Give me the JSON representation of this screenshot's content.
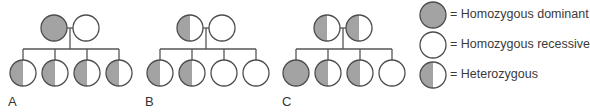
{
  "colors": {
    "fill": "#a3a3a3",
    "stroke": "#4d4d4d",
    "empty": "#ffffff",
    "line": "#555555"
  },
  "pedigrees": [
    {
      "label": "A",
      "parents": [
        "dominant",
        "recessive"
      ],
      "children": [
        "heterozygous",
        "heterozygous",
        "heterozygous",
        "heterozygous"
      ]
    },
    {
      "label": "B",
      "parents": [
        "heterozygous",
        "recessive"
      ],
      "children": [
        "heterozygous",
        "heterozygous",
        "recessive",
        "recessive"
      ]
    },
    {
      "label": "C",
      "parents": [
        "heterozygous",
        "heterozygous"
      ],
      "children": [
        "dominant",
        "heterozygous",
        "heterozygous",
        "recessive"
      ]
    }
  ],
  "legend": [
    {
      "type": "dominant",
      "text": "= Homozygous dominant"
    },
    {
      "type": "recessive",
      "text": "= Homozygous recessive"
    },
    {
      "type": "heterozygous",
      "text": "= Heterozygous"
    }
  ]
}
